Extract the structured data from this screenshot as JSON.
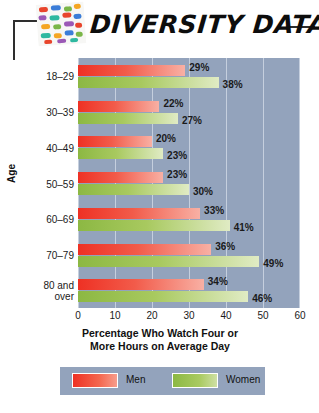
{
  "header": {
    "title": "DIVERSITY DATA",
    "icon": "mosaic-pills-icon"
  },
  "chart_data": {
    "type": "bar",
    "orientation": "horizontal",
    "title_lines": [
      "Percentage Who Watch Four or",
      "More Hours on Average Day"
    ],
    "xlabel": "Percentage Who Watch Four or More Hours on Average Day",
    "ylabel": "Age",
    "categories": [
      "18–29",
      "30–39",
      "40–49",
      "50–59",
      "60–69",
      "70–79",
      "80 and over"
    ],
    "category_lines": [
      [
        "18–29"
      ],
      [
        "30–39"
      ],
      [
        "40–49"
      ],
      [
        "50–59"
      ],
      [
        "60–69"
      ],
      [
        "70–79"
      ],
      [
        "80 and",
        "over"
      ]
    ],
    "series": [
      {
        "name": "Men",
        "color": "#ee3124",
        "values": [
          29,
          22,
          20,
          23,
          33,
          36,
          34
        ],
        "labels": [
          "29%",
          "22%",
          "20%",
          "23%",
          "33%",
          "36%",
          "34%"
        ]
      },
      {
        "name": "Women",
        "color": "#8cb843",
        "values": [
          38,
          27,
          23,
          30,
          41,
          49,
          46
        ],
        "labels": [
          "38%",
          "27%",
          "23%",
          "30%",
          "41%",
          "49%",
          "46%"
        ]
      }
    ],
    "xlim": [
      0,
      60
    ],
    "xticks": [
      0,
      10,
      20,
      30,
      40,
      50,
      60
    ],
    "xtick_labels": [
      "0",
      "10",
      "20",
      "30",
      "40",
      "50",
      "60"
    ],
    "grid": "vertical",
    "legend_position": "bottom",
    "plot_background": "#93a3bc",
    "gridline_color": "#ced7e4"
  }
}
